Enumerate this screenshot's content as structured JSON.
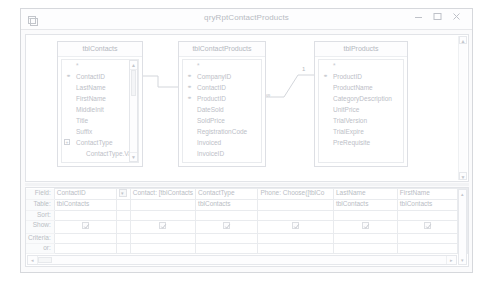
{
  "window": {
    "title": "qryRptContactProducts",
    "app_icon": "query-design-icon",
    "minimize_label": "–",
    "maximize_label": "□",
    "close_label": "✕"
  },
  "diagram": {
    "tables": [
      {
        "name": "tblContacts",
        "fields": [
          {
            "label": "*",
            "key": false,
            "indent": false,
            "expander": false
          },
          {
            "label": "ContactID",
            "key": true,
            "indent": false,
            "expander": false
          },
          {
            "label": "LastName",
            "key": false,
            "indent": false,
            "expander": false
          },
          {
            "label": "FirstName",
            "key": false,
            "indent": false,
            "expander": false
          },
          {
            "label": "MiddleInit",
            "key": false,
            "indent": false,
            "expander": false
          },
          {
            "label": "Title",
            "key": false,
            "indent": false,
            "expander": false
          },
          {
            "label": "Suffix",
            "key": false,
            "indent": false,
            "expander": false
          },
          {
            "label": "ContactType",
            "key": false,
            "indent": false,
            "expander": true
          },
          {
            "label": "ContactType.Value",
            "key": false,
            "indent": true,
            "expander": false
          },
          {
            "label": "BirthDate",
            "key": false,
            "indent": false,
            "expander": false
          }
        ]
      },
      {
        "name": "tblContactProducts",
        "fields": [
          {
            "label": "*",
            "key": false,
            "indent": false,
            "expander": false
          },
          {
            "label": "CompanyID",
            "key": true,
            "indent": false,
            "expander": false
          },
          {
            "label": "ContactID",
            "key": true,
            "indent": false,
            "expander": false
          },
          {
            "label": "ProductID",
            "key": true,
            "indent": false,
            "expander": false
          },
          {
            "label": "DateSold",
            "key": false,
            "indent": false,
            "expander": false
          },
          {
            "label": "SoldPrice",
            "key": false,
            "indent": false,
            "expander": false
          },
          {
            "label": "RegistrationCode",
            "key": false,
            "indent": false,
            "expander": false
          },
          {
            "label": "Invoiced",
            "key": false,
            "indent": false,
            "expander": false
          },
          {
            "label": "InvoiceID",
            "key": false,
            "indent": false,
            "expander": false
          }
        ]
      },
      {
        "name": "tblProducts",
        "fields": [
          {
            "label": "*",
            "key": false,
            "indent": false,
            "expander": false
          },
          {
            "label": "ProductID",
            "key": true,
            "indent": false,
            "expander": false
          },
          {
            "label": "ProductName",
            "key": false,
            "indent": false,
            "expander": false
          },
          {
            "label": "CategoryDescription",
            "key": false,
            "indent": false,
            "expander": false
          },
          {
            "label": "UnitPrice",
            "key": false,
            "indent": false,
            "expander": false
          },
          {
            "label": "TrialVersion",
            "key": false,
            "indent": false,
            "expander": false
          },
          {
            "label": "TrialExpire",
            "key": false,
            "indent": false,
            "expander": false
          },
          {
            "label": "PreRequisite",
            "key": false,
            "indent": false,
            "expander": false
          }
        ]
      }
    ],
    "joins": [
      {
        "left_label": "",
        "right_label": ""
      },
      {
        "left_label": "∞",
        "right_label": "1"
      }
    ],
    "key_glyph": "⚷",
    "scroll_up": "▲",
    "scroll_down": "▼"
  },
  "grid": {
    "row_labels": [
      "Field:",
      "Table:",
      "Sort:",
      "Show:",
      "Criteria:",
      "or:"
    ],
    "columns": [
      {
        "field": "ContactID",
        "table": "tblContacts",
        "sort": "",
        "show": true,
        "criteria": "",
        "or": "",
        "has_dropdown": false
      },
      {
        "field": "Contact: [tblContacts",
        "table": "",
        "sort": "",
        "show": true,
        "criteria": "",
        "or": "",
        "has_dropdown": true
      },
      {
        "field": "ContactType",
        "table": "tblContacts",
        "sort": "",
        "show": true,
        "criteria": "",
        "or": "",
        "has_dropdown": false
      },
      {
        "field": "Phone: Choose([tblCo",
        "table": "",
        "sort": "",
        "show": true,
        "criteria": "",
        "or": "",
        "has_dropdown": false
      },
      {
        "field": "LastName",
        "table": "tblContacts",
        "sort": "",
        "show": true,
        "criteria": "",
        "or": "",
        "has_dropdown": false
      },
      {
        "field": "FirstName",
        "table": "tblContacts",
        "sort": "",
        "show": true,
        "criteria": "",
        "or": "",
        "has_dropdown": false
      },
      {
        "field": "V",
        "table": "tl",
        "sort": "",
        "show": false,
        "criteria": "",
        "or": "",
        "has_dropdown": false
      }
    ],
    "checkbox_glyph": "✓",
    "dropdown_glyph": "▾",
    "hscroll_left": "◂",
    "hscroll_right": "▸",
    "vscroll_up": "▴",
    "vscroll_down": "▾"
  }
}
